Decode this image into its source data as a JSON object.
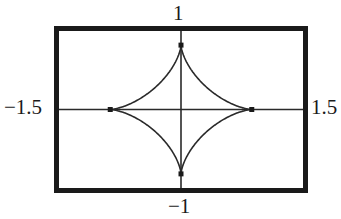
{
  "chart_data": {
    "type": "line",
    "title": "",
    "xlabel": "",
    "ylabel": "",
    "xlim": [
      -1.5,
      1.5
    ],
    "ylim": [
      -1,
      1
    ],
    "grid": false,
    "legend": null,
    "tick_labels": {
      "x_min": "−1.5",
      "x_max": "1.5",
      "y_min": "−1",
      "y_max": "1"
    },
    "series": [
      {
        "name": "astroid",
        "description": "Astroid (4-cusp hypocycloid) x = a cos^3 t, y = b sin^3 t",
        "a": 0.87,
        "b": 0.82,
        "cusps": [
          [
            0.87,
            0
          ],
          [
            0,
            0.82
          ],
          [
            -0.87,
            0
          ],
          [
            0,
            -0.82
          ]
        ]
      }
    ],
    "axes_lines": {
      "x_axis_at_y": 0,
      "y_axis_at_x": 0
    },
    "colors": {
      "frame": "#1a1a1a",
      "curve": "#2a2a2a",
      "axes": "#2a2a2a",
      "background": "#ffffff"
    }
  }
}
